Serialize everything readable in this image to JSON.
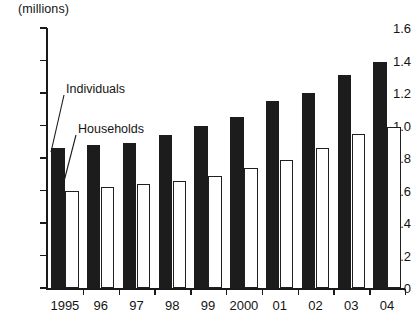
{
  "chart_data": {
    "type": "bar",
    "title": "",
    "unit_note": "(millions)",
    "xlabel": "",
    "ylabel": "",
    "ylim": [
      0,
      1.6
    ],
    "ytick_labels": [
      "0",
      "0.2",
      "0.4",
      "0.6",
      "0.8",
      "1.0",
      "1.2",
      "1.4",
      "1.6"
    ],
    "ytick_values": [
      0,
      0.2,
      0.4,
      0.6,
      0.8,
      1.0,
      1.2,
      1.4,
      1.6
    ],
    "grid": false,
    "legend_position": "inline-annotations",
    "categories": [
      "1995",
      "96",
      "97",
      "98",
      "99",
      "2000",
      "01",
      "02",
      "03",
      "04"
    ],
    "series": [
      {
        "name": "Individuals",
        "color": "#1c1c1c",
        "values": [
          0.86,
          0.88,
          0.89,
          0.94,
          1.0,
          1.05,
          1.15,
          1.2,
          1.31,
          1.39
        ]
      },
      {
        "name": "Households",
        "color": "#ffffff",
        "values": [
          0.6,
          0.62,
          0.64,
          0.66,
          0.69,
          0.74,
          0.79,
          0.86,
          0.95,
          0.99
        ]
      }
    ],
    "annotations": [
      {
        "text": "Individuals",
        "points_to": "first-individuals-bar"
      },
      {
        "text": "Households",
        "points_to": "first-households-bar"
      }
    ]
  }
}
